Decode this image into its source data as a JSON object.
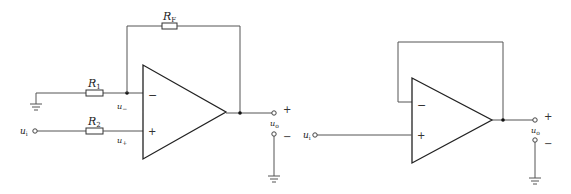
{
  "diagram": {
    "colors": {
      "wire": "#555555",
      "opamp": "#222222",
      "background": "#ffffff"
    },
    "left_circuit": {
      "name": "non-inverting amplifier",
      "resistors": {
        "r1": {
          "label": "R",
          "sub": "1"
        },
        "r2": {
          "label": "R",
          "sub": "2"
        },
        "rf": {
          "label": "R",
          "sub": "F"
        }
      },
      "input": {
        "label": "u",
        "sub": "i"
      },
      "node_minus": {
        "label": "u",
        "sub": "−"
      },
      "node_plus": {
        "label": "u",
        "sub": "+"
      },
      "opamp": {
        "minus_sign": "−",
        "plus_sign": "+"
      },
      "output": {
        "label": "u",
        "sub": "o",
        "plus": "+",
        "minus": "−"
      }
    },
    "right_circuit": {
      "name": "voltage follower",
      "input": {
        "label": "u",
        "sub": "i"
      },
      "opamp": {
        "minus_sign": "−",
        "plus_sign": "+"
      },
      "output": {
        "label": "u",
        "sub": "o",
        "plus": "+",
        "minus": "−"
      }
    }
  }
}
